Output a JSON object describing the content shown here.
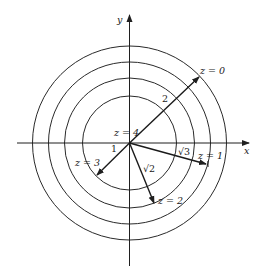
{
  "diagram": {
    "type": "level-curves",
    "center": {
      "x": 129.5,
      "y": 143
    },
    "stroke_color": "#1f1f1f",
    "axes": {
      "x_label": "x",
      "y_label": "y"
    },
    "circles": [
      {
        "r": 47
      },
      {
        "r": 65
      },
      {
        "r": 81
      },
      {
        "r": 97
      }
    ],
    "vectors": [
      {
        "name": "z0",
        "tip": {
          "x": 200,
          "y": 76
        },
        "length_label": "2"
      },
      {
        "name": "z1",
        "tip": {
          "x": 207,
          "y": 164
        },
        "length_label": "√3"
      },
      {
        "name": "z2",
        "tip": {
          "x": 154,
          "y": 204
        },
        "length_label": "√2"
      },
      {
        "name": "z3",
        "tip": {
          "x": 96,
          "y": 176
        },
        "length_label": "1"
      }
    ],
    "labels": {
      "z0": "z = 0",
      "z1": "z = 1",
      "z2": "z = 2",
      "z3": "z = 3",
      "z4": "z = 4",
      "len_2": "2",
      "len_sqrt3": "√3",
      "len_sqrt2": "√2",
      "len_1": "1"
    }
  }
}
